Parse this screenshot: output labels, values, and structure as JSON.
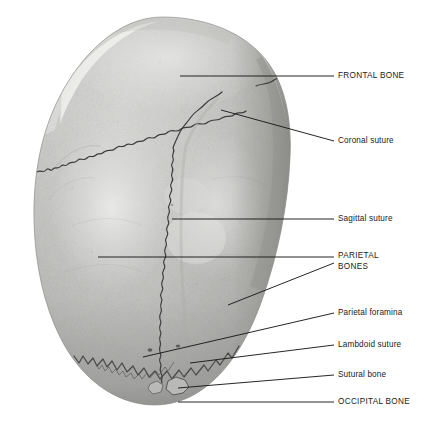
{
  "figure": {
    "orientation": "superior-view",
    "background_color": "#ffffff",
    "line_color": "#1a1a1a",
    "text_color": "#1a1a1a"
  },
  "specimen": {
    "name": "skull-calvaria",
    "bone_light": "#d6d6d4",
    "bone_mid": "#bdbdbb",
    "bone_dark": "#9c9c9a",
    "bone_shadow": "#7e7e7c",
    "suture_color": "#3b3b3b"
  },
  "labels": [
    {
      "id": "frontal-bone",
      "text": "FRONTAL BONE",
      "style": "caps",
      "text_x": 338,
      "text_y": 72,
      "leader": {
        "from_x": 180,
        "from_y": 76,
        "to_x": 334,
        "to_y": 76
      }
    },
    {
      "id": "coronal-suture",
      "text": "Coronal suture",
      "style": "sentence",
      "text_x": 338,
      "text_y": 137,
      "leader": {
        "from_x": 221,
        "from_y": 110,
        "to_x": 334,
        "to_y": 141
      }
    },
    {
      "id": "sagittal-suture",
      "text": "Sagittal suture",
      "style": "sentence",
      "text_x": 338,
      "text_y": 215,
      "leader": {
        "from_x": 172,
        "from_y": 219,
        "to_x": 334,
        "to_y": 219
      }
    },
    {
      "id": "parietal-bones",
      "text": "PARIETAL\nBONES",
      "style": "caps",
      "text_x": 338,
      "text_y": 251,
      "leader": {
        "from_x": 98,
        "from_y": 257,
        "to_x": 334,
        "to_y": 257
      },
      "leader2": {
        "from_x": 228,
        "from_y": 305,
        "to_x": 334,
        "to_y": 263
      }
    },
    {
      "id": "parietal-foramina",
      "text": "Parietal foramina",
      "style": "sentence",
      "text_x": 338,
      "text_y": 309,
      "leader": {
        "from_x": 143,
        "from_y": 357,
        "to_x": 334,
        "to_y": 313
      }
    },
    {
      "id": "lambdoid-suture",
      "text": "Lambdoid suture",
      "style": "sentence",
      "text_x": 338,
      "text_y": 341,
      "leader": {
        "from_x": 190,
        "from_y": 363,
        "to_x": 334,
        "to_y": 345
      }
    },
    {
      "id": "sutural-bone",
      "text": "Sutural bone",
      "style": "sentence",
      "text_x": 338,
      "text_y": 371,
      "leader": {
        "from_x": 178,
        "from_y": 388,
        "to_x": 334,
        "to_y": 375
      }
    },
    {
      "id": "occipital-bone",
      "text": "OCCIPITAL BONE",
      "style": "caps",
      "text_x": 338,
      "text_y": 398,
      "leader": {
        "from_x": 178,
        "from_y": 402,
        "to_x": 334,
        "to_y": 402
      }
    }
  ]
}
